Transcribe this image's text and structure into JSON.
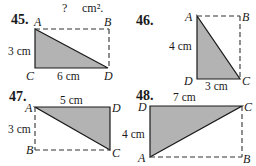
{
  "header": {
    "question_mark": "?",
    "unit": "cm²."
  },
  "problems": [
    {
      "number": "45.",
      "vertices": {
        "top_left": "A",
        "top_right": "B",
        "bottom_left": "C",
        "bottom_right": "D"
      },
      "dimensions": {
        "vertical": "3 cm",
        "horizontal": "6 cm"
      },
      "shaded_triangle": "ACD"
    },
    {
      "number": "46.",
      "vertices": {
        "top_left": "A",
        "top_right": "B",
        "bottom_left": "D",
        "bottom_right": "C"
      },
      "dimensions": {
        "vertical": "4 cm",
        "horizontal": "3 cm"
      },
      "shaded_triangle": "ADC"
    },
    {
      "number": "47.",
      "vertices": {
        "top_left": "A",
        "top_right": "D",
        "bottom_left": "B",
        "bottom_right": "C"
      },
      "dimensions": {
        "vertical": "3 cm",
        "horizontal": "5 cm"
      },
      "shaded_triangle": "ADC"
    },
    {
      "number": "48.",
      "vertices": {
        "top_left": "D",
        "top_right": "C",
        "bottom_left": "A",
        "bottom_right": "B"
      },
      "dimensions": {
        "vertical": "4 cm",
        "horizontal": "7 cm"
      },
      "shaded_triangle": "DCA"
    }
  ]
}
